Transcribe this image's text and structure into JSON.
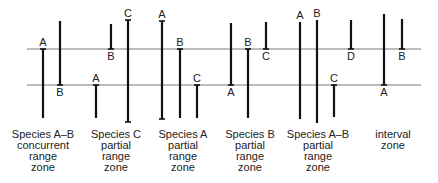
{
  "diagram": {
    "horizons": [
      {
        "name": "upper-horizon"
      },
      {
        "name": "lower-horizon"
      }
    ],
    "zones": [
      {
        "id": "species-ab-concurrent",
        "label_lines": [
          "Species A–B",
          "concurrent",
          "range",
          "zone"
        ],
        "ranges": [
          {
            "taxon": "A",
            "top": "upper",
            "bottom": "below",
            "label_at": "top"
          },
          {
            "taxon": "B",
            "top": "above",
            "bottom": "lower",
            "label_at": "bottom"
          }
        ]
      },
      {
        "id": "species-c-partial",
        "label_lines": [
          "Species C",
          "partial",
          "range",
          "zone"
        ],
        "ranges": [
          {
            "taxon": "A",
            "top": "lower",
            "bottom": "below",
            "label_at": "top"
          },
          {
            "taxon": "B",
            "top": "above",
            "bottom": "upper",
            "label_at": "bottom"
          },
          {
            "taxon": "C",
            "top": "above",
            "bottom": "below",
            "label_at": "top",
            "capped": true
          }
        ]
      },
      {
        "id": "species-a-partial",
        "label_lines": [
          "Species A",
          "partial",
          "range",
          "zone"
        ],
        "ranges": [
          {
            "taxon": "A",
            "top": "above",
            "bottom": "below",
            "label_at": "top",
            "capped": true
          },
          {
            "taxon": "B",
            "top": "upper",
            "bottom": "below",
            "label_at": "top"
          },
          {
            "taxon": "C",
            "top": "lower",
            "bottom": "below",
            "label_at": "top"
          }
        ]
      },
      {
        "id": "species-b-partial",
        "label_lines": [
          "Species B",
          "partial",
          "range",
          "zone"
        ],
        "ranges": [
          {
            "taxon": "A",
            "top": "above",
            "bottom": "lower",
            "label_at": "bottom"
          },
          {
            "taxon": "B",
            "top": "upper",
            "bottom": "below",
            "label_at": "top"
          },
          {
            "taxon": "C",
            "top": "above",
            "bottom": "upper",
            "label_at": "bottom"
          }
        ]
      },
      {
        "id": "species-ab-partial",
        "label_lines": [
          "Species A–B",
          "partial",
          "range",
          "zone"
        ],
        "ranges": [
          {
            "taxon": "A",
            "top": "above",
            "bottom": "below",
            "label_at": "top"
          },
          {
            "taxon": "B",
            "top": "above",
            "bottom": "below",
            "label_at": "top"
          },
          {
            "taxon": "C",
            "top": "lower",
            "bottom": "below",
            "label_at": "top"
          },
          {
            "taxon": "D",
            "top": "above",
            "bottom": "upper",
            "label_at": "bottom"
          }
        ]
      },
      {
        "id": "interval",
        "label_lines": [
          "interval",
          "zone"
        ],
        "ranges": [
          {
            "taxon": "A",
            "top": "above",
            "bottom": "lower",
            "label_at": "bottom"
          },
          {
            "taxon": "B",
            "top": "above",
            "bottom": "upper",
            "label_at": "bottom"
          }
        ]
      }
    ]
  }
}
